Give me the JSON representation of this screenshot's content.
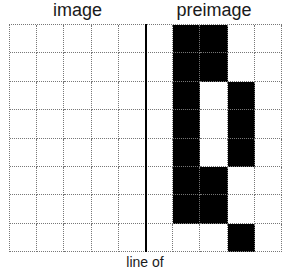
{
  "titles": {
    "left": "image",
    "right": "preimage"
  },
  "caption": "line of",
  "grid": {
    "columns": 10,
    "rows": 8,
    "divider_after_column": 5,
    "fill_color": "#000000",
    "line_color": "#777777",
    "filled_cells": [
      [
        0,
        6
      ],
      [
        0,
        7
      ],
      [
        1,
        6
      ],
      [
        1,
        7
      ],
      [
        2,
        6
      ],
      [
        2,
        8
      ],
      [
        3,
        6
      ],
      [
        3,
        8
      ],
      [
        4,
        6
      ],
      [
        4,
        8
      ],
      [
        5,
        6
      ],
      [
        5,
        7
      ],
      [
        6,
        6
      ],
      [
        6,
        7
      ],
      [
        7,
        8
      ]
    ]
  }
}
